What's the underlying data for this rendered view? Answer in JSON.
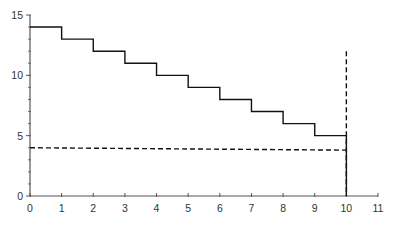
{
  "chart_data": {
    "type": "line",
    "title": "",
    "xlabel": "",
    "ylabel": "",
    "xlim": [
      0,
      11
    ],
    "ylim": [
      0,
      15
    ],
    "grid": false,
    "legend": null,
    "x_ticks": [
      0,
      1,
      2,
      3,
      4,
      5,
      6,
      7,
      8,
      9,
      10,
      11
    ],
    "y_ticks": [
      0,
      5,
      10,
      15
    ],
    "y_minor_ticks": [
      1,
      2,
      3,
      4,
      6,
      7,
      8,
      9,
      11,
      12,
      13,
      14
    ],
    "series": [
      {
        "name": "step",
        "style": "solid",
        "color": "#111111",
        "drawstyle": "steps",
        "x": [
          0,
          1,
          2,
          3,
          4,
          5,
          6,
          7,
          8,
          9,
          10
        ],
        "values": [
          14,
          13,
          12,
          11,
          10,
          9,
          8,
          7,
          6,
          5,
          0
        ]
      },
      {
        "name": "horizontal-dashed",
        "style": "dashed",
        "color": "#111111",
        "x": [
          0,
          10
        ],
        "values": [
          4.0,
          3.8
        ]
      },
      {
        "name": "vertical-dashed",
        "style": "dashed",
        "color": "#111111",
        "x": [
          10,
          10
        ],
        "values": [
          12,
          0
        ]
      }
    ]
  }
}
